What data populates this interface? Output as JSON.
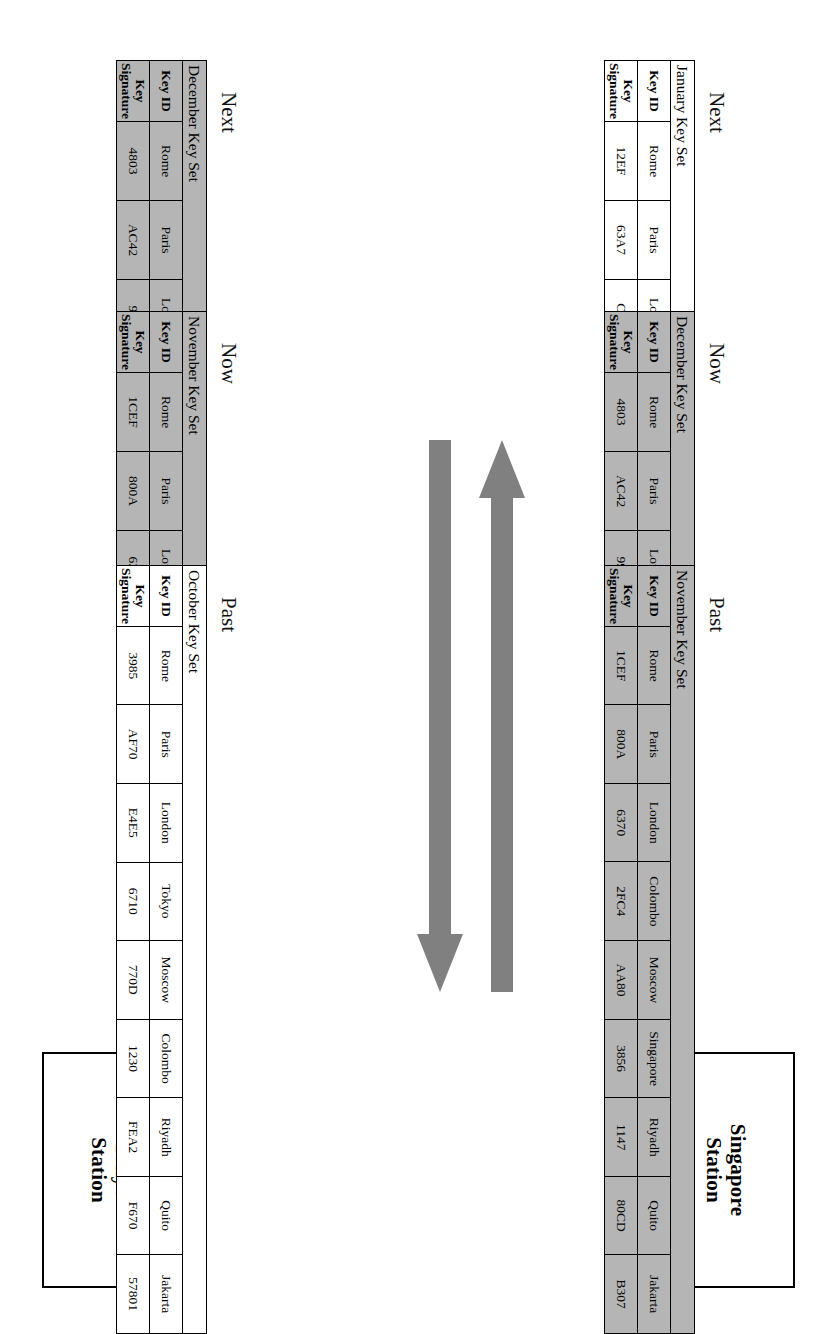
{
  "diagram": {
    "title_hidden": "Key distribution timeline between stations",
    "stations": [
      {
        "name": "station-singapore",
        "label": "Singapore\nStation",
        "line1": "Singapore",
        "line2": "Station"
      },
      {
        "name": "station-tokyo",
        "label": "Tokyo\nStation",
        "line1": "Tokyo",
        "line2": "Station"
      }
    ],
    "arrows": [
      {
        "name": "arrow-to-singapore",
        "direction": "left",
        "color": "#808080"
      },
      {
        "name": "arrow-to-tokyo",
        "direction": "right",
        "color": "#808080"
      }
    ],
    "colors": {
      "arrow_fill": "#808080",
      "shaded_table_bg": "#b5b5b5",
      "plain_table_bg": "#ffffff",
      "border": "#000000"
    },
    "columns": {
      "key_id": "Key ID",
      "key_signature_line1": "Key",
      "key_signature_line2": "Signature"
    },
    "timeline_captions": {
      "next": "Next",
      "now": "Now",
      "past": "Past"
    },
    "rows": [
      {
        "name": "singapore-row",
        "station": "Singapore Station",
        "tables": [
          {
            "name": "keyset-december-singapore",
            "title": "December Key Set",
            "caption": "Next",
            "shaded": true,
            "entries": [
              {
                "id": "Rome",
                "signature": "4803"
              },
              {
                "id": "Paris",
                "signature": "AC42"
              },
              {
                "id": "London",
                "signature": "9903"
              },
              {
                "id": "Tokyo",
                "signature": "FF12"
              },
              {
                "id": "Moscow",
                "signature": "CA75"
              },
              {
                "id": "Colombo",
                "signature": "4495"
              },
              {
                "id": "Riyadh",
                "signature": "1AC3"
              },
              {
                "id": "Quito",
                "signature": "8842"
              },
              {
                "id": "Jakarta",
                "signature": "73CB"
              }
            ]
          },
          {
            "name": "keyset-november-singapore",
            "title": "November Key Set",
            "caption": "Now",
            "shaded": true,
            "entries": [
              {
                "id": "Rome",
                "signature": "1CEF"
              },
              {
                "id": "Paris",
                "signature": "800A"
              },
              {
                "id": "London",
                "signature": "6370"
              },
              {
                "id": "Tokyo",
                "signature": "2FC4"
              },
              {
                "id": "Moscow",
                "signature": "AA80"
              },
              {
                "id": "Colombo",
                "signature": "3856"
              },
              {
                "id": "Riyadh",
                "signature": "1147"
              },
              {
                "id": "Quito",
                "signature": "80CD"
              },
              {
                "id": "Jakarta",
                "signature": "B307"
              }
            ]
          },
          {
            "name": "keyset-october-singapore",
            "title": "October Key Set",
            "caption": "Past",
            "shaded": false,
            "entries": [
              {
                "id": "Rome",
                "signature": "3985"
              },
              {
                "id": "Paris",
                "signature": "AF70"
              },
              {
                "id": "London",
                "signature": "E4E5"
              },
              {
                "id": "Tokyo",
                "signature": "6710"
              },
              {
                "id": "Moscow",
                "signature": "770D"
              },
              {
                "id": "Colombo",
                "signature": "1230"
              },
              {
                "id": "Riyadh",
                "signature": "FEA2"
              },
              {
                "id": "Quito",
                "signature": "F670"
              },
              {
                "id": "Jakarta",
                "signature": "57801"
              }
            ]
          }
        ]
      },
      {
        "name": "tokyo-row",
        "station": "Tokyo Station",
        "tables": [
          {
            "name": "keyset-january-tokyo",
            "title": "January Key Set",
            "caption": "Next",
            "shaded": false,
            "entries": [
              {
                "id": "Rome",
                "signature": "12EF"
              },
              {
                "id": "Paris",
                "signature": "63A7"
              },
              {
                "id": "London",
                "signature": "CC80"
              },
              {
                "id": "Colombo",
                "signature": "D242"
              },
              {
                "id": "Moscow",
                "signature": "E790"
              },
              {
                "id": "Singapore",
                "signature": "385A"
              },
              {
                "id": "Riyadh",
                "signature": "1DE4"
              },
              {
                "id": "Quito",
                "signature": "8702"
              },
              {
                "id": "Jakarta",
                "signature": "AC25"
              }
            ]
          },
          {
            "name": "keyset-december-tokyo",
            "title": "December Key Set",
            "caption": "Now",
            "shaded": true,
            "entries": [
              {
                "id": "Rome",
                "signature": "4803"
              },
              {
                "id": "Paris",
                "signature": "AC42"
              },
              {
                "id": "London",
                "signature": "9903"
              },
              {
                "id": "Colombo",
                "signature": "FF12"
              },
              {
                "id": "Moscow",
                "signature": "CA75"
              },
              {
                "id": "Singapore",
                "signature": "4495"
              },
              {
                "id": "Riyadh",
                "signature": "1AC3"
              },
              {
                "id": "Quito",
                "signature": "8842"
              },
              {
                "id": "Jakarta",
                "signature": "73CB"
              }
            ]
          },
          {
            "name": "keyset-november-tokyo",
            "title": "November Key Set",
            "caption": "Past",
            "shaded": true,
            "entries": [
              {
                "id": "Rome",
                "signature": "1CEF"
              },
              {
                "id": "Paris",
                "signature": "800A"
              },
              {
                "id": "London",
                "signature": "6370"
              },
              {
                "id": "Colombo",
                "signature": "2FC4"
              },
              {
                "id": "Moscow",
                "signature": "AA80"
              },
              {
                "id": "Singapore",
                "signature": "3856"
              },
              {
                "id": "Riyadh",
                "signature": "1147"
              },
              {
                "id": "Quito",
                "signature": "80CD"
              },
              {
                "id": "Jakarta",
                "signature": "B307"
              }
            ]
          }
        ]
      }
    ]
  }
}
